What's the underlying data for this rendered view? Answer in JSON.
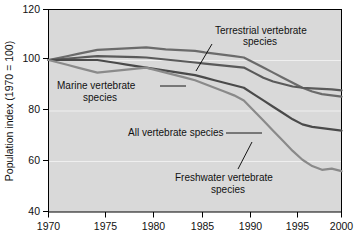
{
  "chart_data": {
    "type": "line",
    "title": "",
    "xlabel": "",
    "ylabel": "Population index (1970 = 100)",
    "xlim": [
      1970,
      2000
    ],
    "ylim": [
      40,
      120
    ],
    "yticks": [
      40,
      60,
      80,
      100,
      120
    ],
    "xticks": [
      1970,
      1975,
      1980,
      1985,
      1990,
      1995,
      2000
    ],
    "grid": true,
    "legend": "inline-annotations",
    "x": [
      1970,
      1971,
      1972,
      1973,
      1974,
      1975,
      1976,
      1977,
      1978,
      1979,
      1980,
      1981,
      1982,
      1983,
      1984,
      1985,
      1986,
      1987,
      1988,
      1989,
      1990,
      1991,
      1992,
      1993,
      1994,
      1995,
      1996,
      1997,
      1998,
      1999,
      2000
    ],
    "series": [
      {
        "name": "Terrestrial vertebrate species",
        "color": "#6b6b6b",
        "values": [
          100,
          100.8,
          101.6,
          102.4,
          103.2,
          104.0,
          104.2,
          104.4,
          104.6,
          104.8,
          105.0,
          104.6,
          104.2,
          104.0,
          103.8,
          103.6,
          103.0,
          102.5,
          102.0,
          101.5,
          101.0,
          99.0,
          97.0,
          95.0,
          93.0,
          91.0,
          89.0,
          87.5,
          86.5,
          86.0,
          85.5
        ]
      },
      {
        "name": "Marine vertebrate species",
        "color": "#5a5a5a",
        "values": [
          100,
          100.3,
          100.6,
          100.9,
          101.2,
          101.5,
          101.4,
          101.3,
          101.2,
          101.1,
          101.0,
          100.6,
          100.2,
          99.8,
          99.4,
          99.0,
          98.6,
          98.2,
          97.8,
          97.4,
          97.0,
          95.0,
          93.0,
          91.5,
          90.5,
          89.5,
          89.0,
          88.8,
          88.6,
          88.4,
          88.0
        ]
      },
      {
        "name": "All vertebrate species",
        "color": "#4a4a4a",
        "values": [
          100,
          100.0,
          100.0,
          100.0,
          100.0,
          100.0,
          99.4,
          98.8,
          98.2,
          97.6,
          97.0,
          96.4,
          95.8,
          95.2,
          94.6,
          94.0,
          93.0,
          92.0,
          91.0,
          90.0,
          89.0,
          86.5,
          84.0,
          81.5,
          79.0,
          76.5,
          74.5,
          73.5,
          73.0,
          72.5,
          72.0
        ]
      },
      {
        "name": "Freshwater vertebrate species",
        "color": "#8a8a8a",
        "values": [
          100,
          99.0,
          98.0,
          97.0,
          96.0,
          95.0,
          95.4,
          95.8,
          96.2,
          96.6,
          97.0,
          96.0,
          95.0,
          94.0,
          93.0,
          92.0,
          90.5,
          89.0,
          87.5,
          86.0,
          84.0,
          80.0,
          76.0,
          72.0,
          68.0,
          64.0,
          60.5,
          58.0,
          56.5,
          57.0,
          56.0
        ]
      }
    ],
    "annotations": [
      {
        "id": "terrestrial",
        "text_line1": "Terrestrial vertebrate",
        "text_line2": "species"
      },
      {
        "id": "marine",
        "text_line1": "Marine vertebrate",
        "text_line2": "species"
      },
      {
        "id": "all",
        "text_line1": "All vertebrate species",
        "text_line2": ""
      },
      {
        "id": "freshwater",
        "text_line1": "Freshwater vertebrate",
        "text_line2": "species"
      }
    ]
  },
  "axis": {
    "y_title": "Population index (1970 = 100)",
    "y_tick_labels": [
      "120",
      "100",
      "80",
      "60",
      "40"
    ],
    "x_tick_labels": [
      "1970",
      "1975",
      "1980",
      "1985",
      "1990",
      "1995",
      "2000"
    ]
  },
  "labels": {
    "terrestrial_l1": "Terrestrial vertebrate",
    "terrestrial_l2": "species",
    "marine_l1": "Marine vertebrate",
    "marine_l2": "species",
    "all_l1": "All vertebrate species",
    "freshwater_l1": "Freshwater vertebrate",
    "freshwater_l2": "species"
  },
  "colors": {
    "plot_background": "#d9d9d9",
    "page_background": "#ffffff",
    "axis": "#000000",
    "gridline": "#efefef"
  }
}
